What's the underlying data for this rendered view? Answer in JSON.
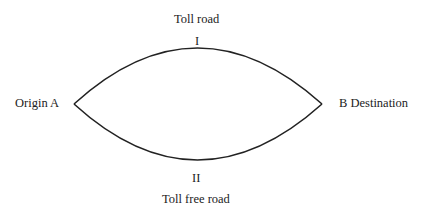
{
  "diagram": {
    "nodes": {
      "origin": "Origin A",
      "destination": "B Destination"
    },
    "routes": [
      {
        "id": "I",
        "numeral": "I",
        "label": "Toll road"
      },
      {
        "id": "II",
        "numeral": "II",
        "label": "Toll free road"
      }
    ],
    "stroke_color": "#222222"
  }
}
